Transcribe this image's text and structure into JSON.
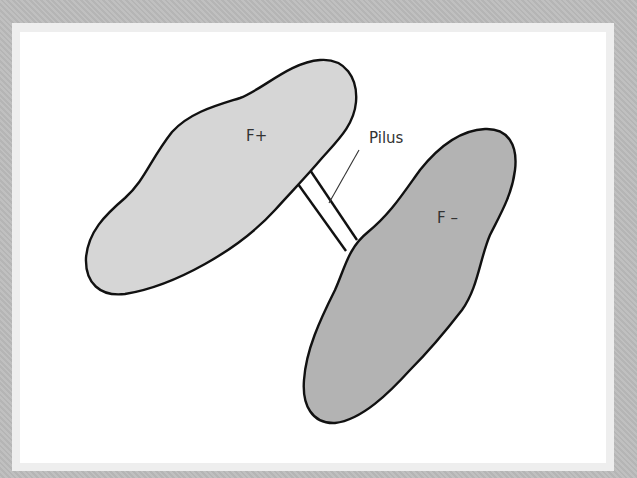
{
  "diagram": {
    "colors": {
      "frame": "#bcbcbc",
      "panel": "#ffffff",
      "f_plus_fill": "#d6d6d6",
      "f_minus_fill": "#b3b3b3",
      "outline": "#111111",
      "label": "#333333"
    },
    "cells": [
      {
        "id": "f-plus",
        "label": "F+"
      },
      {
        "id": "f-minus",
        "label": "F –"
      }
    ],
    "connector": {
      "label": "Pilus"
    }
  }
}
